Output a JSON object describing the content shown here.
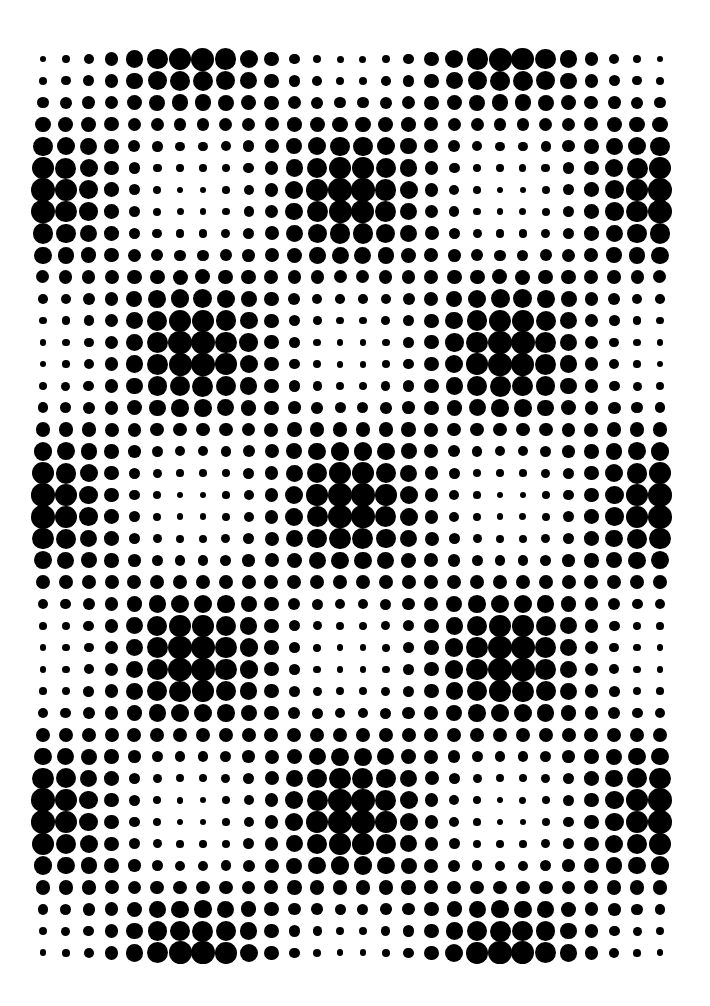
{
  "artwork": {
    "type": "halftone-dot-pattern",
    "background_color": "#ffffff",
    "dot_color": "#000000",
    "grid": {
      "columns": 28,
      "rows": 42,
      "origin_x": 43,
      "origin_y": 59,
      "spacing_x": 22.85,
      "spacing_y": 21.8
    },
    "dot_size": {
      "min_diameter": 6.5,
      "max_diameter": 24
    },
    "pattern": {
      "description": "Checkerboard lattice of large-dot clusters separated by small-dot regions",
      "period_columns": 13.8,
      "period_rows": 14.2,
      "column_phase": 0.3,
      "row_phase": -6.2,
      "exponent": 1.2
    }
  }
}
